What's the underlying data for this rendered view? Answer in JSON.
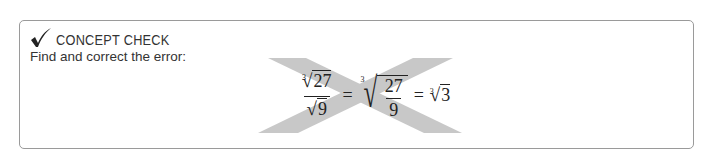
{
  "concept_check": {
    "heading": "CONCEPT CHECK",
    "icon": "checkmark-icon",
    "prompt": "Find and correct the error:",
    "formula": {
      "lhs": {
        "numerator": {
          "index": "3",
          "radicand": "27"
        },
        "denominator": {
          "radicand": "9"
        }
      },
      "equals_1": "=",
      "middle": {
        "index": "3",
        "numerator": "27",
        "denominator": "9"
      },
      "equals_2": "=",
      "rhs": {
        "index": "3",
        "radicand": "3"
      }
    },
    "overlay": "cross-out-x-icon",
    "colors": {
      "border": "#9a9a9a",
      "cross": "#c8c8c8",
      "text": "#333333"
    }
  }
}
